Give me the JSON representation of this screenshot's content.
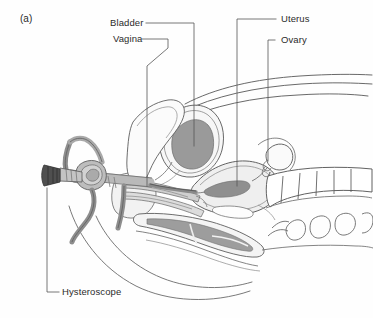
{
  "figure": {
    "panel_tag": "(a)",
    "background_color": "#fefefe",
    "line_color": "#4a4a4a",
    "leader_color": "#5a5a5a",
    "text_color": "#2b2b2b"
  },
  "labels": {
    "bladder": "Bladder",
    "vagina": "Vagina",
    "uterus": "Uterus",
    "ovary": "Ovary",
    "hysteroscope": "Hysteroscope"
  },
  "anatomy": {
    "shading": {
      "bladder_lumen": "#9a9a9a",
      "uterus_body": "#efefef",
      "uterine_cavity": "#8f8f8f",
      "rectum": "#9d9d9d",
      "vaginal_wall": "#cfcfcf",
      "instrument_body": "#b9b9b9",
      "eyepiece": "#4f4f4f",
      "soft_tissue": "#e8e8e8"
    },
    "structures": [
      "abdominal-wall",
      "bladder",
      "uterus",
      "ovary",
      "vagina",
      "rectum",
      "sacrum",
      "coccyx",
      "pubic-bone",
      "perineum",
      "thigh-outline"
    ]
  },
  "instrument": {
    "name": "hysteroscope",
    "parts": [
      "eyepiece",
      "barrel",
      "inflow-tube",
      "outflow-tube",
      "sheath"
    ]
  }
}
